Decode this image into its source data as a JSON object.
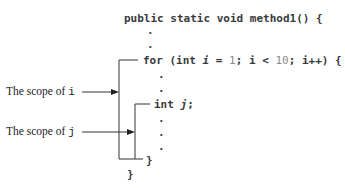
{
  "code": {
    "method_signature": "public static void method1() {",
    "dot": ".",
    "for_keyword": "for (int ",
    "for_var": "i",
    "for_assign": " = ",
    "for_init": "1",
    "for_cond_a": "; i < ",
    "for_limit": "10",
    "for_cond_b": "; i++) {",
    "decl_keyword": "int ",
    "decl_var": "j",
    "decl_end": ";",
    "inner_close": "}",
    "outer_close": "}"
  },
  "labels": {
    "scope_i_text": "The scope of ",
    "scope_i_var": "i",
    "scope_j_text": "The scope of ",
    "scope_j_var": "j"
  },
  "colors": {
    "text": "#3a3a3a",
    "literal": "#8a8a8a",
    "line": "#333333"
  }
}
